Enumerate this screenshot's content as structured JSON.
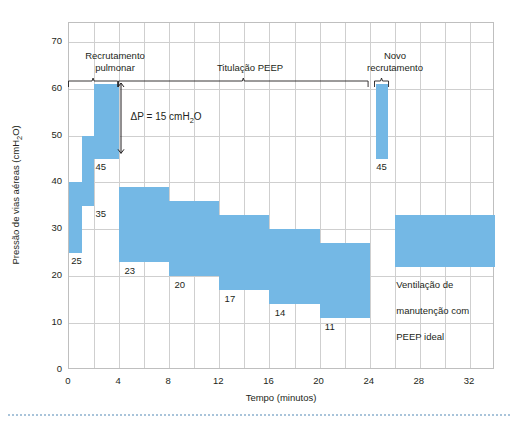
{
  "chart_data": {
    "type": "bar",
    "title": "",
    "xlabel": "Tempo (minutos)",
    "ylabel": "Pressão de vias aéreas (cmH₂O)",
    "xlim": [
      0,
      34
    ],
    "ylim": [
      0,
      74
    ],
    "xticks": [
      0,
      4,
      8,
      12,
      16,
      20,
      24,
      28,
      32
    ],
    "yticks": [
      0,
      10,
      20,
      30,
      40,
      50,
      60,
      70
    ],
    "xtick_labels": [
      "0",
      "4",
      "8",
      "12",
      "16",
      "20",
      "24",
      "28",
      "32"
    ],
    "ytick_labels": [
      "0",
      "10",
      "20",
      "30",
      "40",
      "50",
      "60",
      "70"
    ],
    "grid": true,
    "grid_x_step": 2,
    "grid_y_step": 10,
    "legend": "none",
    "bar_color": "#74b8e5",
    "series": [
      {
        "name": "Pressão de vias aéreas",
        "bars": [
          {
            "x_start": 0,
            "x_end": 1,
            "low": 25,
            "high": 40,
            "label": "25",
            "label_x": 0.25,
            "label_y": 23.0
          },
          {
            "x_start": 1,
            "x_end": 2,
            "low": 35,
            "high": 50,
            "label": "35",
            "label_x": 2.2,
            "label_y": 33.0
          },
          {
            "x_start": 2,
            "x_end": 4,
            "low": 45,
            "high": 61,
            "label": "45",
            "label_x": 2.2,
            "label_y": 43.0
          },
          {
            "x_start": 4,
            "x_end": 8,
            "low": 23,
            "high": 39,
            "label": "23",
            "label_x": 4.5,
            "label_y": 21.0
          },
          {
            "x_start": 8,
            "x_end": 12,
            "low": 20,
            "high": 36,
            "label": "20",
            "label_x": 8.5,
            "label_y": 18.0
          },
          {
            "x_start": 12,
            "x_end": 16,
            "low": 17,
            "high": 33,
            "label": "17",
            "label_x": 12.5,
            "label_y": 15.0
          },
          {
            "x_start": 16,
            "x_end": 20,
            "low": 14,
            "high": 30,
            "label": "14",
            "label_x": 16.5,
            "label_y": 12.0
          },
          {
            "x_start": 20,
            "x_end": 24,
            "low": 11,
            "high": 27,
            "label": "11",
            "label_x": 20.5,
            "label_y": 9.0
          },
          {
            "x_start": 24.5,
            "x_end": 25.5,
            "low": 45,
            "high": 61,
            "label": "45",
            "label_x": 24.6,
            "label_y": 43.0
          },
          {
            "x_start": 26,
            "x_end": 34,
            "low": 22,
            "high": 33,
            "label": "",
            "label_x": 0,
            "label_y": 0
          }
        ]
      }
    ],
    "annotations": [
      {
        "name": "recrutamento-pulmonar",
        "text": "Recrutamento\npulmonar",
        "bracket_start": 0,
        "bracket_end": 4,
        "y": 62
      },
      {
        "name": "titulacao-peep",
        "text": "Titulação PEEP",
        "bracket_start": 4,
        "bracket_end": 24,
        "y": 62
      },
      {
        "name": "novo-recrutamento",
        "text": "Novo\nrecrutamento",
        "bracket_start": 24.4,
        "bracket_end": 25.6,
        "y": 62
      },
      {
        "name": "delta-p",
        "text": "ΔP = 15 cmH₂O",
        "from_y": 61,
        "to_y": 46,
        "x": 4.2
      },
      {
        "name": "ventilacao-manutencao",
        "text": "Ventilação de\nmanutenção com\nPEEP ideal",
        "x": 26.2,
        "y": 21
      }
    ]
  },
  "labels": {
    "y_axis_title_main": "Pressão de vias aéreas (cmH",
    "y_axis_title_sub": "2",
    "y_axis_title_end": "O)",
    "x_axis_title": "Tempo (minutos)",
    "deltap_pre": "ΔP = 15 cmH",
    "deltap_sub": "2",
    "deltap_post": "O",
    "phase_recruitment_line1": "Recrutamento",
    "phase_recruitment_line2": "pulmonar",
    "phase_titration": "Titulação PEEP",
    "phase_new_recruitment_line1": "Novo",
    "phase_new_recruitment_line2": "recrutamento",
    "maintenance_line1": "Ventilação de",
    "maintenance_line2": "manutenção com",
    "maintenance_line3": "PEEP ideal"
  },
  "colors": {
    "bar": "#74b8e5",
    "grid": "#cfcfcf",
    "frame": "#bfbfbf",
    "text": "#231f20",
    "dots": "#a9c4da"
  }
}
